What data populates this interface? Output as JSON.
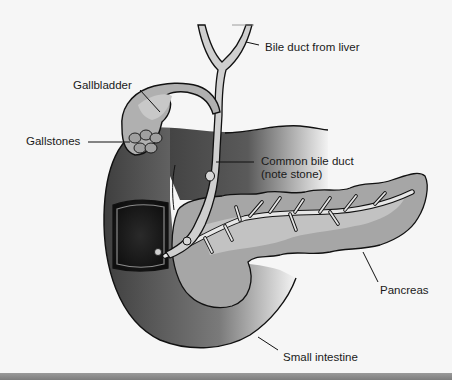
{
  "diagram": {
    "type": "anatomical-illustration",
    "labels": {
      "bile_duct_from_liver": "Bile duct from liver",
      "gallbladder": "Gallbladder",
      "gallstones": "Gallstones",
      "common_bile_duct_line1": "Common bile duct",
      "common_bile_duct_line2": "(note stone)",
      "pancreas": "Pancreas",
      "small_intestine": "Small intestine"
    },
    "colors": {
      "background": "#f6f6f6",
      "outline": "#111111",
      "duct_fill": "#cfcfcf",
      "gallbladder_fill": "#a9a9a9",
      "intestine_dark": "#4a4a4a",
      "opening_dark": "#161616",
      "pancreas_fill": "#a6a6a6",
      "pancreas_light": "#c2c2c2",
      "pancreatic_duct": "#e6e6e6",
      "bottom_bar": "#8a8a8a"
    }
  }
}
